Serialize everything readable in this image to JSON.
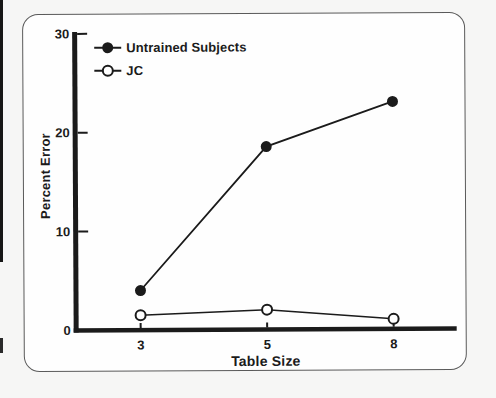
{
  "colors": {
    "ink": "#1b1b1b",
    "card_border": "#5a5a5a",
    "card_background": "#fefefe",
    "page_background": "#f6f6f5",
    "open_marker_fill": "#ffffff"
  },
  "chart_data": {
    "type": "line",
    "title": "",
    "categories": [
      "3",
      "5",
      "8"
    ],
    "series": [
      {
        "name": "Untrained Subjects",
        "marker": "filled-circle",
        "values": [
          4,
          18.5,
          23
        ]
      },
      {
        "name": "JC",
        "marker": "open-circle",
        "values": [
          1.5,
          2,
          1
        ]
      }
    ],
    "xlabel": "Table Size",
    "ylabel": "Percent Error",
    "ylim": [
      0,
      30
    ],
    "yticks": [
      30,
      20,
      10,
      0
    ],
    "grid": false,
    "legend_position": "top-left",
    "x_spacing": "equal"
  }
}
